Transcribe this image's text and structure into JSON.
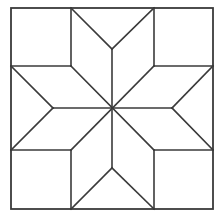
{
  "figure": {
    "title": "",
    "kind": "eight-point star quilt block (LeMoyne star)",
    "width": 218,
    "height": 216,
    "stroke_color": "#3a3a3a",
    "background": "#ffffff",
    "outer_square": {
      "x": 11,
      "y": 8,
      "w": 202,
      "h": 201
    },
    "center": [
      112,
      108
    ],
    "lines": [
      {
        "name": "top-left-square-right-edge",
        "x1": 71,
        "y1": 8,
        "x2": 71,
        "y2": 66
      },
      {
        "name": "top-left-square-bottom-edge",
        "x1": 11,
        "y1": 66,
        "x2": 71,
        "y2": 66
      },
      {
        "name": "top-right-square-left-edge",
        "x1": 154,
        "y1": 8,
        "x2": 154,
        "y2": 66
      },
      {
        "name": "top-right-square-bottom-edge",
        "x1": 154,
        "y1": 66,
        "x2": 213,
        "y2": 66
      },
      {
        "name": "bottom-left-square-right-edge",
        "x1": 71,
        "y1": 150,
        "x2": 71,
        "y2": 209
      },
      {
        "name": "bottom-left-square-top-edge",
        "x1": 11,
        "y1": 150,
        "x2": 71,
        "y2": 150
      },
      {
        "name": "bottom-right-square-left-edge",
        "x1": 154,
        "y1": 150,
        "x2": 154,
        "y2": 209
      },
      {
        "name": "bottom-right-square-top-edge",
        "x1": 154,
        "y1": 150,
        "x2": 213,
        "y2": 150
      },
      {
        "name": "diagonal-tl-to-br",
        "x1": 71,
        "y1": 66,
        "x2": 154,
        "y2": 150
      },
      {
        "name": "diagonal-tr-to-bl",
        "x1": 154,
        "y1": 66,
        "x2": 71,
        "y2": 150
      },
      {
        "name": "vertical-center-line",
        "x1": 112,
        "y1": 49,
        "x2": 112,
        "y2": 168
      },
      {
        "name": "horizontal-center-line",
        "x1": 53,
        "y1": 108,
        "x2": 172,
        "y2": 108
      },
      {
        "name": "top-v-left",
        "x1": 71,
        "y1": 8,
        "x2": 112,
        "y2": 49
      },
      {
        "name": "top-v-right",
        "x1": 154,
        "y1": 8,
        "x2": 112,
        "y2": 49
      },
      {
        "name": "bottom-v-left",
        "x1": 71,
        "y1": 209,
        "x2": 112,
        "y2": 168
      },
      {
        "name": "bottom-v-right",
        "x1": 154,
        "y1": 209,
        "x2": 112,
        "y2": 168
      },
      {
        "name": "left-v-top",
        "x1": 11,
        "y1": 66,
        "x2": 53,
        "y2": 108
      },
      {
        "name": "left-v-bottom",
        "x1": 11,
        "y1": 150,
        "x2": 53,
        "y2": 108
      },
      {
        "name": "right-v-top",
        "x1": 213,
        "y1": 66,
        "x2": 172,
        "y2": 108
      },
      {
        "name": "right-v-bottom",
        "x1": 213,
        "y1": 150,
        "x2": 172,
        "y2": 108
      }
    ]
  }
}
